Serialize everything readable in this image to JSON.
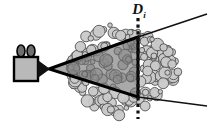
{
  "figure": {
    "name": "camera-view-frustum-over-foliage",
    "background_color": "#ffffff",
    "width": 213,
    "height": 130,
    "labels": {
      "depth_plane": "D",
      "depth_plane_subscript": "i",
      "depth_plane_full": "Di"
    },
    "colors": {
      "ink": "#111111",
      "outline": "#000000",
      "camera_body_fill": "#b9b9b9",
      "camera_reel_fill": "#6e6e6e",
      "frustum_fill": "#9a9a9a",
      "foliage_fill": "#c9c9c9",
      "foliage_outline": "#4a4a4a",
      "background": "#ffffff"
    },
    "camera": {
      "name": "movie-camera",
      "body_x": 14,
      "body_y": 57,
      "body_w": 24,
      "body_h": 24,
      "reel_count": 2,
      "lens_tip_x": 49,
      "lens_tip_y": 69
    },
    "frustum": {
      "name": "view-frustum",
      "apex_x": 49,
      "apex_y": 69,
      "top_vertex_x": 138,
      "top_vertex_y": 37,
      "bottom_vertex_x": 138,
      "bottom_vertex_y": 97,
      "far_plane_x": 138,
      "stroke_width": 3
    },
    "rays": {
      "name": "diverging-view-rays",
      "upper_end_x": 207,
      "upper_end_y": 14,
      "lower_end_x": 207,
      "lower_end_y": 106,
      "stroke_width": 1.6
    },
    "depth_plane_line": {
      "name": "depth-plane-dotted-line",
      "x": 138,
      "y_top": 18,
      "y_bottom": 119,
      "style": "dotted",
      "stroke_width": 3.2
    },
    "label_position": {
      "x": 139,
      "y": 14
    },
    "foliage": {
      "name": "foliage-blob-cloud",
      "blob_count": 190,
      "x_min": 70,
      "x_max": 178,
      "y_min": 24,
      "y_max": 116,
      "radius_min": 2.2,
      "radius_max": 6.4
    }
  }
}
